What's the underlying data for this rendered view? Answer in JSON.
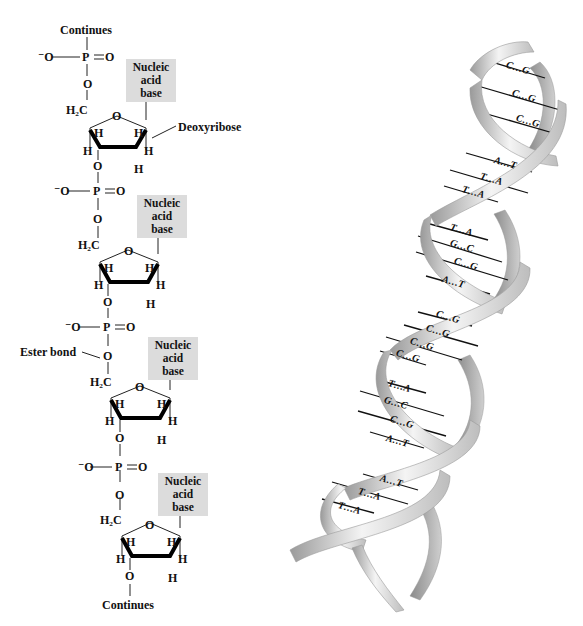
{
  "structure": {
    "top_label": "Continues",
    "bottom_label": "Continues",
    "sugar_label": "Deoxyribose",
    "ester_label": "Ester bond",
    "base_box_lines": [
      "Nucleic",
      "acid",
      "base"
    ],
    "phosphate": {
      "o_minus": "⁻O",
      "p": "P",
      "double_o": "O"
    },
    "linker_o": "O",
    "ch2": "H₂C",
    "ring_o": "O",
    "h": "H",
    "nucleotides": [
      {
        "base_box": "Nucleic acid base"
      },
      {
        "base_box": "Nucleic acid base"
      },
      {
        "base_box": "Nucleic acid base"
      },
      {
        "base_box": "Nucleic acid base"
      }
    ]
  },
  "helix": {
    "base_pairs": [
      "C…G",
      "C…G",
      "C…G",
      "A…T",
      "T…A",
      "T…A",
      "T…A",
      "G…C",
      "C…G",
      "A…T",
      "C…G",
      "C…G",
      "C…G",
      "C…G",
      "T…A",
      "G…C",
      "C…G",
      "A…T",
      "A…T",
      "T…A",
      "T…A"
    ],
    "colors": {
      "ribbon_light": "#f2f2f2",
      "ribbon_dark": "#8c8c8c",
      "rung": "#111111"
    }
  },
  "colors": {
    "base_box": "#dcdcdc",
    "ink": "#111111",
    "background": "#ffffff"
  }
}
